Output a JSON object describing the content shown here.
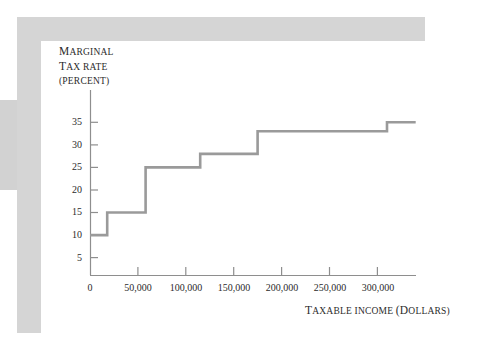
{
  "figure": {
    "background_color": "#ffffff",
    "card_background": "#ffffff",
    "frame_color": "#d5d5d5",
    "left_band_color": "#d2d2d2"
  },
  "chart_data": {
    "type": "line",
    "step": "post",
    "title": "",
    "subtitle": "",
    "xlabel": "TAXABLE INCOME (DOLLARS)",
    "ylabel": "MARGINAL TAX RATE (PERCENT)",
    "ylabel_lines": [
      "MARGINAL",
      "TAX RATE",
      "(PERCENT)"
    ],
    "line_color": "#9a9a9a",
    "axis_color": "#8e8e8e",
    "grid": false,
    "legend": null,
    "xlim": [
      0,
      340000
    ],
    "ylim": [
      0,
      37
    ],
    "xticks": [
      0,
      50000,
      100000,
      150000,
      200000,
      250000,
      300000
    ],
    "xtick_labels": [
      "0",
      "50,000",
      "100,000",
      "150,000",
      "200,000",
      "250,000",
      "300,000"
    ],
    "yticks": [
      5,
      10,
      15,
      20,
      25,
      30,
      35
    ],
    "ytick_labels": [
      "5",
      "10",
      "15",
      "20",
      "25",
      "30",
      "35"
    ],
    "brackets": [
      {
        "income_from": 0,
        "income_to": 18000,
        "rate": 10
      },
      {
        "income_from": 18000,
        "income_to": 58000,
        "rate": 15
      },
      {
        "income_from": 58000,
        "income_to": 115000,
        "rate": 25
      },
      {
        "income_from": 115000,
        "income_to": 175000,
        "rate": 28
      },
      {
        "income_from": 175000,
        "income_to": 310000,
        "rate": 33
      },
      {
        "income_from": 310000,
        "income_to": 340000,
        "rate": 35
      }
    ],
    "x": [
      0,
      18000,
      18000,
      58000,
      58000,
      115000,
      115000,
      175000,
      175000,
      310000,
      310000,
      340000
    ],
    "values": [
      10,
      10,
      15,
      15,
      25,
      25,
      28,
      28,
      33,
      33,
      35,
      35
    ]
  }
}
